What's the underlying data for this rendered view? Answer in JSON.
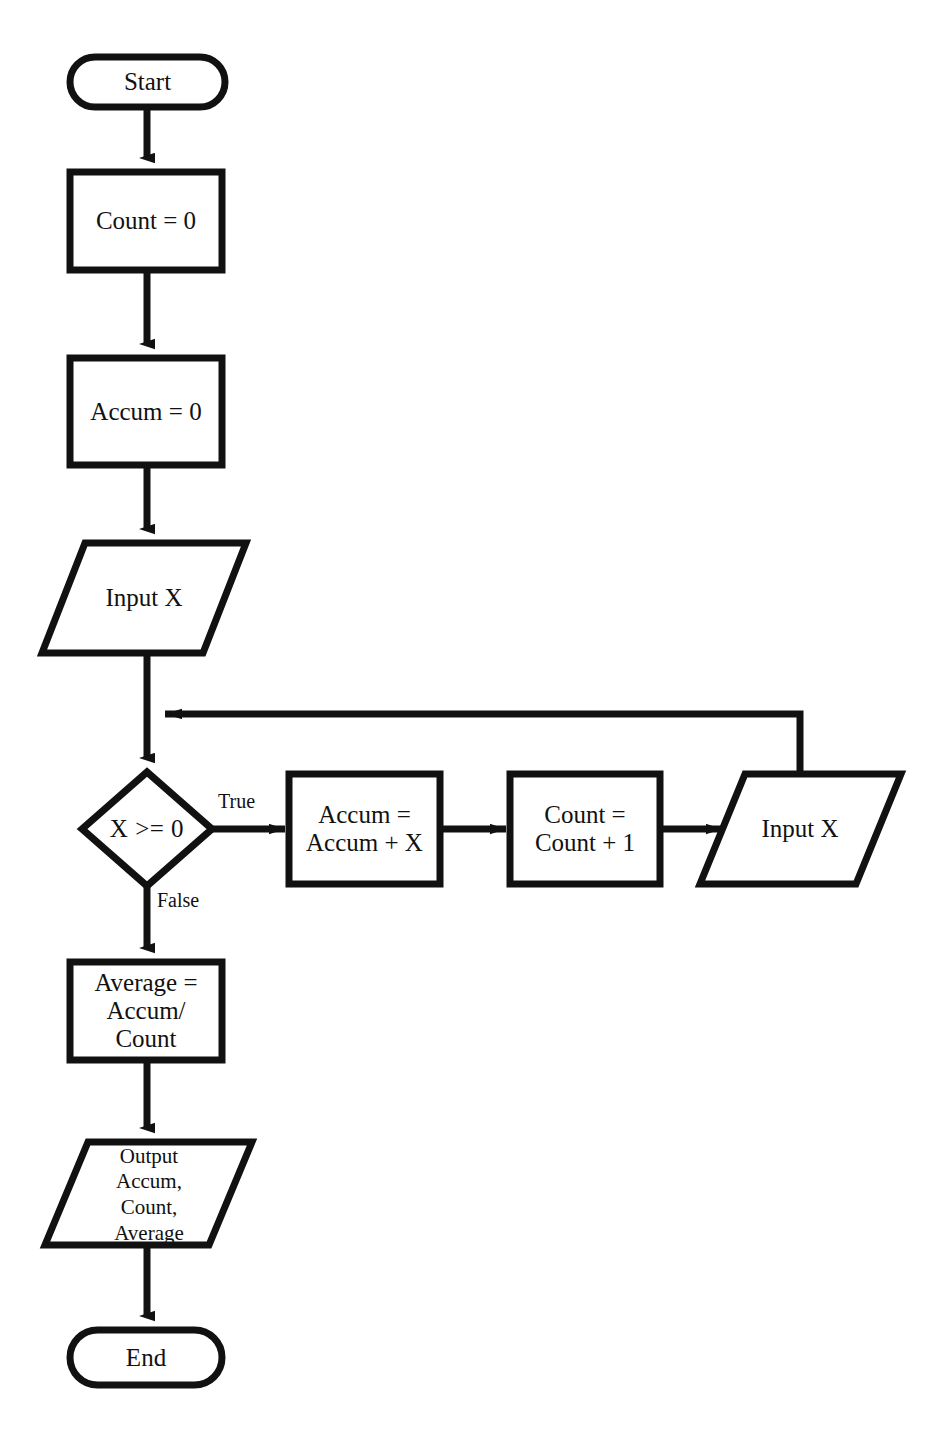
{
  "diagram": {
    "type": "flowchart",
    "stroke_color": "#111111",
    "fill_color": "#ffffff",
    "background_color": "#ffffff"
  },
  "nodes": {
    "start": {
      "label": "Start",
      "shape": "terminal"
    },
    "count_init": {
      "label": "Count = 0",
      "shape": "process"
    },
    "accum_init": {
      "label": "Accum = 0",
      "shape": "process"
    },
    "input_x_first": {
      "label": "Input X",
      "shape": "input-output"
    },
    "decision": {
      "label": "X >= 0",
      "shape": "decision"
    },
    "accum_add": {
      "label": "Accum =\nAccum + X",
      "shape": "process"
    },
    "count_add": {
      "label": "Count =\nCount + 1",
      "shape": "process"
    },
    "input_x_loop": {
      "label": "Input X",
      "shape": "input-output"
    },
    "average": {
      "label": "Average =\nAccum/\nCount",
      "shape": "process"
    },
    "output": {
      "label": "Output\nAccum,\nCount,\nAverage",
      "shape": "input-output"
    },
    "end": {
      "label": "End",
      "shape": "terminal"
    }
  },
  "edges": {
    "true_branch": {
      "label": "True"
    },
    "false_branch": {
      "label": "False"
    }
  }
}
